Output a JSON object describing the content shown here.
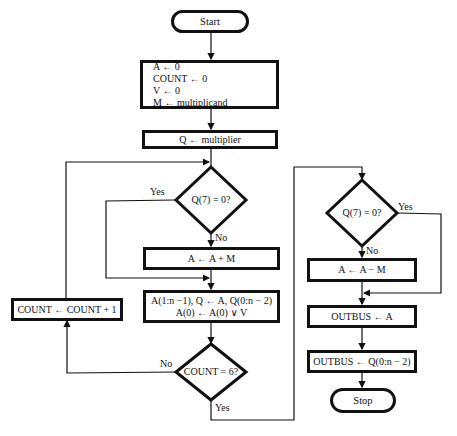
{
  "diagram": {
    "type": "flowchart",
    "nodes": {
      "start": "Start",
      "init": [
        "A ← 0",
        "COUNT ← 0",
        "V ← 0",
        "M ← multiplicand"
      ],
      "load_q": "Q ← multiplier",
      "test_q7_left": "Q(7) = 0?",
      "add": "A ← A + M",
      "shift": [
        "A(1:n −1), Q ← A, Q(0:n − 2)",
        "A(0) ← A(0) ∨ V"
      ],
      "test_count": "COUNT = 6?",
      "increment": "COUNT ← COUNT + 1",
      "test_q7_right": "Q(7) = 0?",
      "subtract": "A ← A − M",
      "out_a": "OUTBUS ← A",
      "out_q": "OUTBUS ← Q(0:n − 2)",
      "stop": "Stop"
    },
    "edge_labels": {
      "left_yes": "Yes",
      "left_no": "No",
      "count_no": "No",
      "count_yes": "Yes",
      "right_yes": "Yes",
      "right_no": "No"
    }
  }
}
